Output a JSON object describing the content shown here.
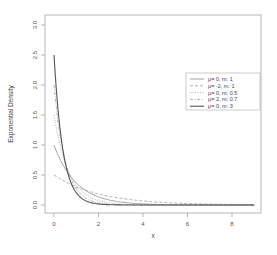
{
  "chart_data": {
    "type": "line",
    "title": "",
    "xlabel": "x",
    "ylabel": "Exponential Density",
    "xlim": [
      0,
      9
    ],
    "ylim": [
      0,
      3
    ],
    "x_ticks": [
      "0",
      "2",
      "4",
      "6",
      "8"
    ],
    "y_ticks": [
      "0.0",
      "0.5",
      "1.0",
      "1.5",
      "2.0",
      "2.5",
      "3.0"
    ],
    "grid": false,
    "legend_position": "upper right",
    "series": [
      {
        "name": "μ= 0, m: 1",
        "rate": 1.0,
        "style": "solid",
        "color": "#8c8c8c"
      },
      {
        "name": "μ= -2, m: 1",
        "rate": 0.5,
        "style": "dashed",
        "color": "#9a9a9a"
      },
      {
        "name": "μ= 0, m: 0.5",
        "rate": 1.5,
        "style": "dotted",
        "color": "#9a9a9a"
      },
      {
        "name": "μ= 2, m: 0.7",
        "rate": 2.0,
        "style": "dashdot",
        "color": "#9a9a9a"
      },
      {
        "name": "μ= 0, m: 3",
        "rate": 2.5,
        "style": "solid",
        "color": "#555555"
      }
    ]
  }
}
